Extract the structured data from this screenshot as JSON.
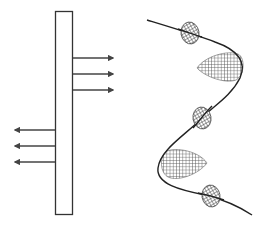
{
  "diagram": {
    "colors": {
      "stroke": "#333333",
      "arrow": "#444444",
      "hatch": "#555555",
      "fill": "#ffffff"
    },
    "left_panel": {
      "element": "vertical-slab",
      "right_arrows_count": 3,
      "left_arrows_count": 3
    },
    "right_panel": {
      "element": "helix-curve",
      "disks_count": 3,
      "cones_count": 2
    }
  }
}
